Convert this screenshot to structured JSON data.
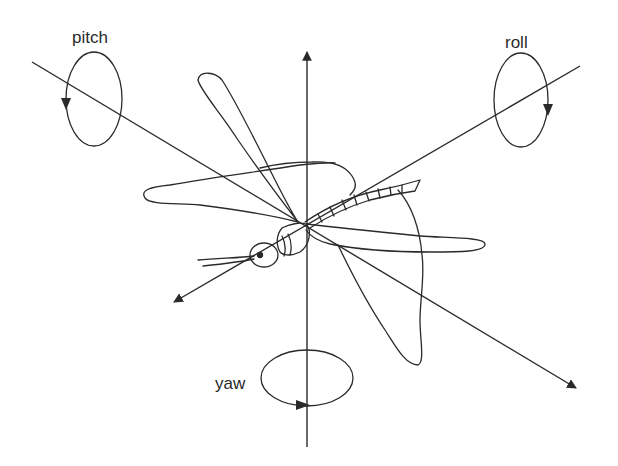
{
  "diagram": {
    "stroke_color": "#2a2a2a",
    "background": "#ffffff",
    "axes": [
      {
        "name": "yaw",
        "label": "yaw",
        "orientation": "vertical"
      },
      {
        "name": "pitch",
        "label": "pitch",
        "orientation": "lateral (wing-span axis)"
      },
      {
        "name": "roll",
        "label": "roll",
        "orientation": "longitudinal (body axis)"
      }
    ],
    "labels": {
      "pitch": "pitch",
      "roll": "roll",
      "yaw": "yaw"
    }
  }
}
